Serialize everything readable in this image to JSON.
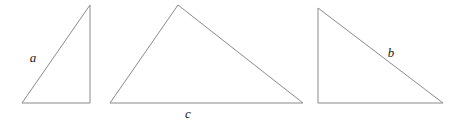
{
  "figure": {
    "kind": "geometry-figure",
    "background_color": "#ffffff",
    "stroke_color": "#8a8a8a",
    "label_color": "#1a1a1a",
    "canvas": {
      "width": 465,
      "height": 124
    }
  },
  "shapes": [
    {
      "name": "triangle-a",
      "type": "triangle",
      "points": "22,103 90,5 90,103",
      "label": {
        "text": "a",
        "x": 33,
        "y": 62,
        "side": "hypotenuse"
      }
    },
    {
      "name": "triangle-c",
      "type": "triangle",
      "points": "110,103 178,5 303,103",
      "label": {
        "text": "c",
        "x": 188,
        "y": 118,
        "side": "base"
      }
    },
    {
      "name": "triangle-b",
      "type": "triangle",
      "points": "318,8 318,103 443,103",
      "label": {
        "text": "b",
        "x": 391,
        "y": 57,
        "side": "hypotenuse"
      }
    }
  ]
}
